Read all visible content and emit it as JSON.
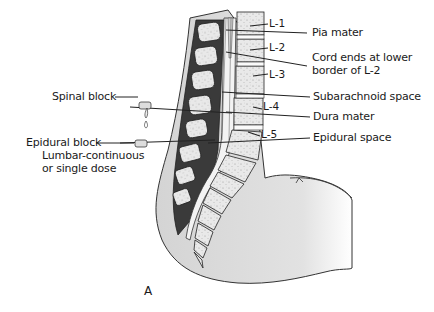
{
  "figure": {
    "panel_letter": "A",
    "vertebra_labels": [
      "L-1",
      "L-2",
      "L-3",
      "L-4",
      "L-5"
    ],
    "right_labels": {
      "pia_mater": "Pia mater",
      "cord_ends_line1": "Cord ends at lower",
      "cord_ends_line2": "border of L-2",
      "subarachnoid_space": "Subarachnoid space",
      "dura_mater": "Dura mater",
      "epidural_space": "Epidural space"
    },
    "left_labels": {
      "spinal_block": "Spinal block",
      "epidural_block": "Epidural block",
      "epidural_block_sub1": "Lumbar-continuous",
      "epidural_block_sub2": "or single dose"
    },
    "colors": {
      "body_fill": "#d9d9d9",
      "vertebra_fill": "#e6e6e6",
      "dark_band": "#333333",
      "line": "#1a1a1a"
    }
  }
}
